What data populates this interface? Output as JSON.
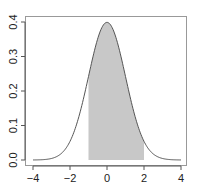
{
  "chart_data": {
    "type": "area",
    "title": "",
    "xlabel": "",
    "ylabel": "",
    "xlim": [
      -4,
      4
    ],
    "ylim": [
      0,
      0.4
    ],
    "x_ticks": [
      "-4",
      "-2",
      "0",
      "2",
      "4"
    ],
    "y_ticks": [
      "0.0",
      "0.1",
      "0.2",
      "0.3",
      "0.4"
    ],
    "grid": false,
    "legend": null,
    "series": [
      {
        "name": "normal density",
        "type": "line",
        "function": "dnorm(x, 0, 1)",
        "x": [
          -4,
          -3,
          -2,
          -1.5,
          -1,
          -0.5,
          0,
          0.5,
          1,
          1.5,
          2,
          3,
          4
        ],
        "y": [
          0.0001,
          0.0044,
          0.054,
          0.1295,
          0.242,
          0.3521,
          0.3989,
          0.3521,
          0.242,
          0.1295,
          0.054,
          0.0044,
          0.0001
        ]
      },
      {
        "name": "shaded region",
        "type": "area",
        "from": -1,
        "to": 2,
        "fill": "#c8c8c8"
      }
    ]
  },
  "colors": {
    "curve": "#555555",
    "fill": "#c8c8c8",
    "frame": "#888888"
  }
}
